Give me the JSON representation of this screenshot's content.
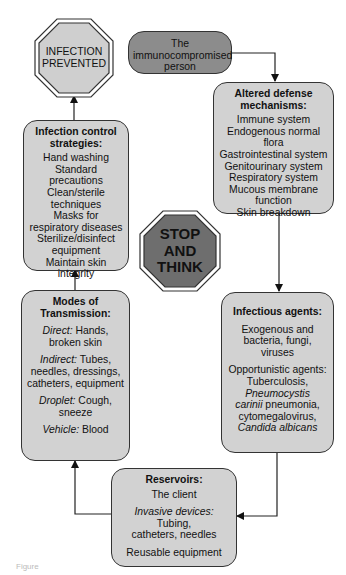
{
  "diagram": {
    "stop_infection_prevented": {
      "lines": [
        "INFECTION",
        "PREVENTED"
      ]
    },
    "stop_think": {
      "lines": [
        "STOP",
        "AND",
        "THINK"
      ]
    },
    "immunocompromised": {
      "lines": [
        "The",
        "immunocompromised",
        "person"
      ]
    },
    "altered_defense": {
      "title_lines": [
        "Altered defense",
        "mechanisms:"
      ],
      "items": [
        "Immune system",
        "Endogenous normal flora",
        "Gastrointestinal system",
        "Genitourinary system",
        "Respiratory system",
        "Mucous membrane",
        "function",
        "Skin breakdown"
      ]
    },
    "infectious_agents": {
      "title": "Infectious agents:",
      "para1": [
        "Exogenous and",
        "bacteria, fungi, viruses"
      ],
      "para2_line1": "Opportunistic agents:",
      "para2_line2": "Tuberculosis,",
      "para2_line3_italic": "Pneumocystis",
      "para2_line4_italic": "carinii",
      "para2_line4_rest": " pneumonia,",
      "para2_line5": "cytomegalovirus,",
      "para2_line6_italic": "Candida albicans"
    },
    "reservoirs": {
      "title": "Reservoirs:",
      "item1": "The client",
      "item2_italic": "Invasive devices:",
      "item2_rest": " Tubing,",
      "item2_line2": "catheters, needles",
      "item3": "Reusable equipment"
    },
    "modes": {
      "title_lines": [
        "Modes of",
        "Transmission:"
      ],
      "direct_label": "Direct:",
      "direct_rest": " Hands,",
      "direct_line2": "broken skin",
      "indirect_label": "Indirect:",
      "indirect_rest": " Tubes,",
      "indirect_line2": "needles, dressings,",
      "indirect_line3": "catheters, equipment",
      "droplet_label": "Droplet:",
      "droplet_rest": " Cough, sneeze",
      "vehicle_label": "Vehicle:",
      "vehicle_rest": " Blood"
    },
    "infection_control": {
      "title_lines": [
        "Infection control",
        "strategies:"
      ],
      "items": [
        "Hand washing",
        "Standard precautions",
        "Clean/sterile",
        "techniques",
        "Masks for",
        "respiratory diseases",
        "Sterilize/disinfect",
        "equipment",
        "Maintain skin integrity"
      ]
    },
    "colors": {
      "box_fill": "#d2d2d2",
      "pill_fill": "#8c8c8c",
      "stop_think_fill": "#6e6e6e",
      "prevented_fill": "#cfcfcf",
      "stroke": "#333333"
    }
  },
  "caption": "Figure"
}
